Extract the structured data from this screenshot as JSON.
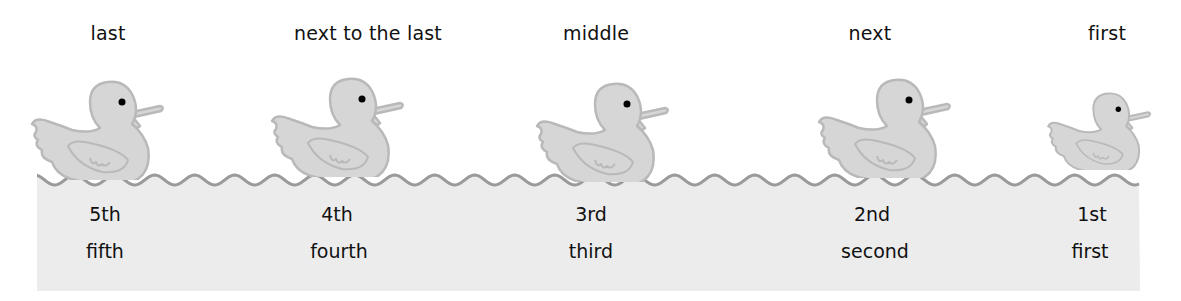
{
  "ducks": [
    {
      "position": "last",
      "ordinal": "5th",
      "word": "fifth",
      "x": 108,
      "duck_x": 28,
      "duck_y": 80,
      "scale": 1.0
    },
    {
      "position": "next to the last",
      "ordinal": "4th",
      "word": "fourth",
      "x": 340,
      "duck_x": 268,
      "duck_y": 77,
      "scale": 1.0
    },
    {
      "position": "middle",
      "ordinal": "3rd",
      "word": "third",
      "x": 596,
      "duck_x": 533,
      "duck_y": 82,
      "scale": 1.0
    },
    {
      "position": "next",
      "ordinal": "2nd",
      "word": "second",
      "x": 870,
      "duck_x": 815,
      "duck_y": 78,
      "scale": 1.0
    },
    {
      "position": "first",
      "ordinal": "1st",
      "word": "first",
      "x": 1095,
      "duck_x": 1045,
      "duck_y": 92,
      "scale": 0.78
    }
  ],
  "colors": {
    "duck_fill": "#d6d6d6",
    "duck_outline": "#b9b9b9",
    "water_fill": "#ececec",
    "wave_line": "#9a9a9a",
    "eye": "#000000"
  }
}
